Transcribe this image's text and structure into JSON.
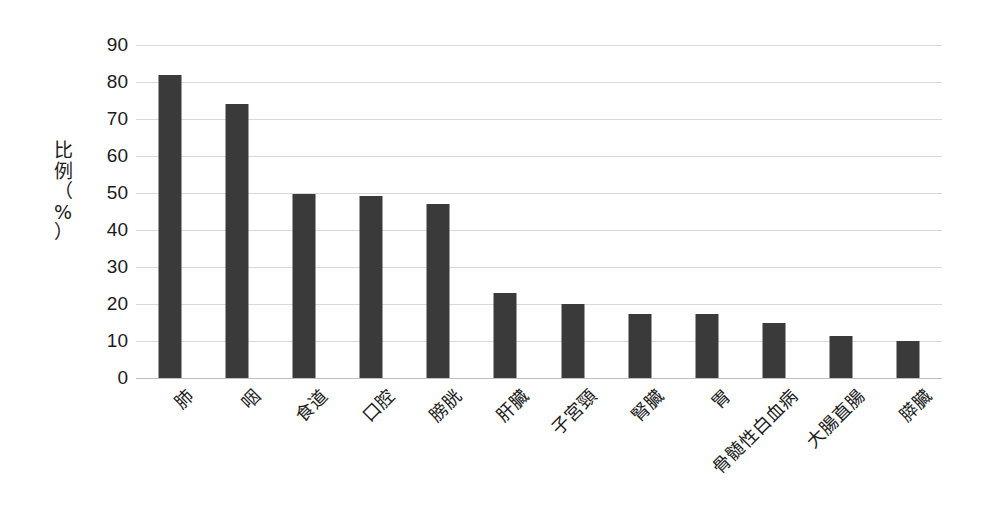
{
  "chart_data": {
    "type": "bar",
    "title": "",
    "xlabel": "",
    "ylabel": "比例（%）",
    "ylabel_chars": "比\n例\n（\n%\n）",
    "categories": [
      "肺",
      "咽",
      "食道",
      "口腔",
      "膀胱",
      "肝臓",
      "子宮頸",
      "腎臓",
      "胃",
      "骨髄性白血病",
      "大腸直腸",
      "膵臓"
    ],
    "values": [
      82,
      74,
      49.8,
      49.3,
      47,
      23,
      20,
      17.3,
      17.2,
      15,
      11.3,
      10
    ],
    "ylim": [
      0,
      90
    ],
    "ytick_step": 10,
    "yticks": [
      0,
      10,
      20,
      30,
      40,
      50,
      60,
      70,
      80,
      90
    ],
    "ytick_labels": [
      "0",
      "10",
      "20",
      "30",
      "40",
      "50",
      "60",
      "70",
      "80",
      "90"
    ],
    "grid": true,
    "grid_axis": "y",
    "legend": false,
    "legend_position": "none",
    "bar_color": "#3a3a3a",
    "grid_color": "#d9d9d9",
    "background_color": "#ffffff",
    "text_color": "#1b1b1b",
    "xtick_rotation": -45
  }
}
